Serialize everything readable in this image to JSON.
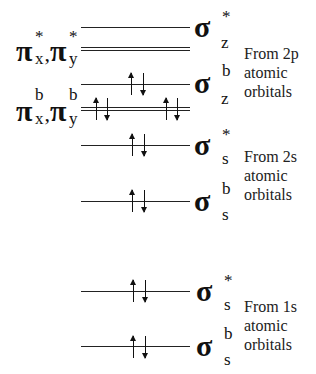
{
  "diagram": {
    "type": "molecular-orbital-energy-diagram",
    "levels": [
      {
        "id": "sigma-z-antibonding",
        "symbol": "σ",
        "sup": "*",
        "sub": "z",
        "y": 27,
        "double": false,
        "electrons": []
      },
      {
        "id": "pi-xy-antibonding",
        "symbol": "π",
        "y": 48,
        "double": true,
        "electrons": []
      },
      {
        "id": "sigma-z-bonding",
        "symbol": "σ",
        "sup": "b",
        "sub": "z",
        "y": 84,
        "double": false,
        "electrons": [
          "up",
          "down"
        ]
      },
      {
        "id": "pi-xy-bonding",
        "symbol": "π",
        "y": 108,
        "double": true,
        "electrons": [
          "up",
          "down",
          "up",
          "down"
        ]
      },
      {
        "id": "sigma-2s-antibonding",
        "symbol": "σ",
        "sup": "*",
        "sub": "s",
        "y": 145,
        "double": false,
        "electrons": [
          "up",
          "down"
        ]
      },
      {
        "id": "sigma-2s-bonding",
        "symbol": "σ",
        "sup": "b",
        "sub": "s",
        "y": 201,
        "double": false,
        "electrons": [
          "up",
          "down"
        ]
      },
      {
        "id": "sigma-1s-antibonding",
        "symbol": "σ",
        "sup": "*",
        "sub": "s",
        "y": 291,
        "double": false,
        "electrons": [
          "up",
          "down"
        ]
      },
      {
        "id": "sigma-1s-bonding",
        "symbol": "σ",
        "sup": "b",
        "sub": "s",
        "y": 346,
        "double": false,
        "electrons": [
          "up",
          "down"
        ]
      }
    ],
    "pi_labels": {
      "antibonding": {
        "symbol": "π",
        "x_sup": "*",
        "x_sub": "x",
        "y_sup": "*",
        "y_sub": "y",
        "comma": ","
      },
      "bonding": {
        "symbol": "π",
        "x_sup": "b",
        "x_sub": "x",
        "y_sup": "b",
        "y_sub": "y",
        "comma": ","
      }
    },
    "groups": [
      {
        "line1": "From 2p",
        "line2": "atomic",
        "line3": "orbitals"
      },
      {
        "line1": "From 2s",
        "line2": "atomic",
        "line3": "orbitals"
      },
      {
        "line1": "From 1s",
        "line2": "atomic",
        "line3": "orbitals"
      }
    ]
  }
}
